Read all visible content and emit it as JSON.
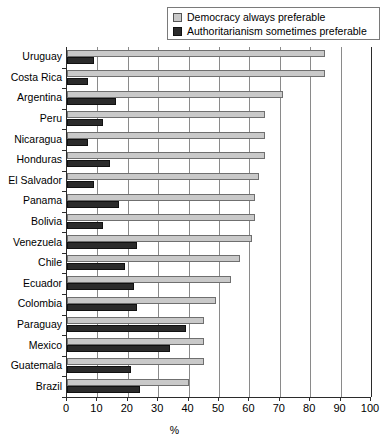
{
  "legend": {
    "position": "top-right",
    "items": [
      {
        "label": "Democracy always preferable",
        "color": "#c9c9c9",
        "swatch": "light-gray-square-icon"
      },
      {
        "label": "Authoritarianism sometimes preferable",
        "color": "#2b2b2b",
        "swatch": "dark-square-icon"
      }
    ]
  },
  "axis": {
    "x_title": "%",
    "ticks": [
      "0",
      "10",
      "20",
      "30",
      "40",
      "50",
      "60",
      "70",
      "80",
      "90",
      "100"
    ]
  },
  "chart_data": {
    "type": "bar",
    "orientation": "horizontal",
    "title": "",
    "xlabel": "%",
    "ylabel": "",
    "xlim": [
      0,
      100
    ],
    "grid": true,
    "legend_position": "top-right",
    "categories": [
      "Uruguay",
      "Costa Rica",
      "Argentina",
      "Peru",
      "Nicaragua",
      "Honduras",
      "El Salvador",
      "Panama",
      "Bolivia",
      "Venezuela",
      "Chile",
      "Ecuador",
      "Colombia",
      "Paraguay",
      "Mexico",
      "Guatemala",
      "Brazil"
    ],
    "series": [
      {
        "name": "Democracy always preferable",
        "color": "#c9c9c9",
        "values": [
          85,
          85,
          71,
          65,
          65,
          65,
          63,
          62,
          62,
          61,
          57,
          54,
          49,
          45,
          45,
          45,
          40
        ]
      },
      {
        "name": "Authoritarianism sometimes preferable",
        "color": "#2b2b2b",
        "values": [
          9,
          7,
          16,
          12,
          7,
          14,
          9,
          17,
          12,
          23,
          19,
          22,
          23,
          39,
          34,
          21,
          24
        ]
      }
    ]
  }
}
